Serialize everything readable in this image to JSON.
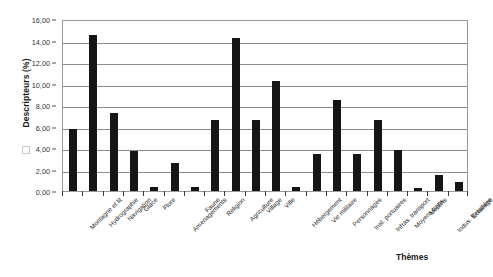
{
  "chart_data": {
    "type": "bar",
    "title": "",
    "xlabel": "Thèmes",
    "ylabel": "Descripteurs (%)",
    "ylim": [
      0,
      16
    ],
    "ytick_step": 2,
    "ytick_labels": [
      "0,00",
      "2,00",
      "4,00",
      "6,00",
      "8,00",
      "10,00",
      "12,00",
      "14,00",
      "16,00"
    ],
    "grid": true,
    "legend": "none",
    "bar_color": "#151515",
    "decimal_separator": ",",
    "categories": [
      "Montagne et lit",
      "Hydrographie",
      "Navigation",
      "Glace",
      "Flore",
      "Amenagements",
      "Faune",
      "Religion",
      "Agriculture",
      "Village",
      "Ville",
      "Hébergement",
      "Vie militaire",
      "Personnages",
      "Inst. portuaires",
      "Infras. transport",
      "Moyens trans.",
      "Moulins",
      "Indus. forestière",
      "Éclairage"
    ],
    "values": [
      5.8,
      14.5,
      7.3,
      3.7,
      0.4,
      2.6,
      0.4,
      6.6,
      14.2,
      6.6,
      10.2,
      0.4,
      3.4,
      8.5,
      3.4,
      6.6,
      3.8,
      0.3,
      1.5,
      0.8
    ],
    "values_label": [
      "5,80",
      "14,50",
      "7,30",
      "3,70",
      "0,40",
      "2,60",
      "0,40",
      "6,60",
      "14,20",
      "6,60",
      "10,20",
      "0,40",
      "3,40",
      "8,50",
      "3,40",
      "6,60",
      "3,80",
      "0,30",
      "1,50",
      "0,80"
    ]
  },
  "axis": {
    "y_title": "Descripteurs (%)",
    "x_title": "Thèmes"
  }
}
